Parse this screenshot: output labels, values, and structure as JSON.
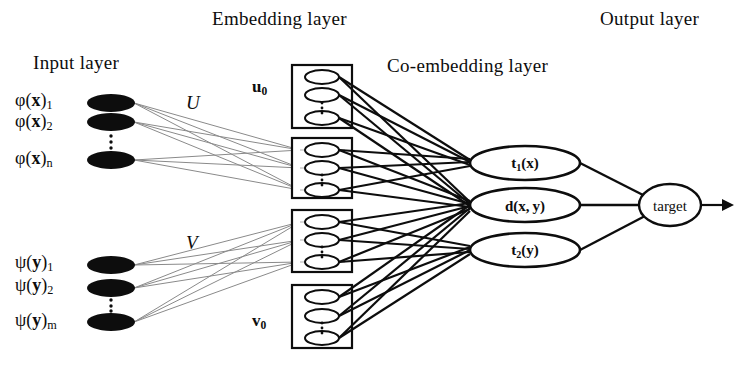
{
  "diagram": {
    "title_labels": {
      "input": "Input layer",
      "embedding": "Embedding layer",
      "coembedding": "Co-embedding layer",
      "output": "Output layer"
    },
    "weights": {
      "u": "U",
      "v": "V"
    },
    "input_nodes_x": [
      {
        "label_html": "&phi;(<span class=\"bi\">x</span>)<sub>1</sub>",
        "text": "ϕ(x)1"
      },
      {
        "label_html": "&phi;(<span class=\"bi\">x</span>)<sub>2</sub>",
        "text": "ϕ(x)2"
      },
      {
        "label_html": "&phi;(<span class=\"bi\">x</span>)<sub>n</sub>",
        "text": "ϕ(x)n"
      }
    ],
    "input_nodes_y": [
      {
        "label_html": "&psi;(<span class=\"bi\">y</span>)<sub>1</sub>",
        "text": "ψ(y)1"
      },
      {
        "label_html": "&psi;(<span class=\"bi\">y</span>)<sub>2</sub>",
        "text": "ψ(y)2"
      },
      {
        "label_html": "&psi;(<span class=\"bi\">y</span>)<sub>m</sub>",
        "text": "ψ(y)m"
      }
    ],
    "embedding_blocks": [
      {
        "label_html": "<span class=\"bi\">u</span><sub>0</sub>",
        "text": "u0",
        "has_label": true
      },
      {
        "label_html": "",
        "text": "",
        "has_label": false
      },
      {
        "label_html": "",
        "text": "",
        "has_label": false
      },
      {
        "label_html": "<span class=\"bi\">v</span><sub>0</sub>",
        "text": "v0",
        "has_label": true
      }
    ],
    "coembedding_nodes": [
      {
        "label_html": "t<sub>1</sub>(<span class=\"bi\">x</span>)",
        "text": "t1(x)"
      },
      {
        "label_html": "d(<span class=\"bi\">x</span>,&thinsp;<span class=\"bi\">y</span>)",
        "text": "d(x, y)"
      },
      {
        "label_html": "t<sub>2</sub>(<span class=\"bi\">y</span>)",
        "text": "t2(y)"
      }
    ],
    "output_node": {
      "label": "target"
    },
    "colors": {
      "ink": "#0d0d0d",
      "faint_edge": "#8a8a8a",
      "background": "#ffffff"
    }
  }
}
